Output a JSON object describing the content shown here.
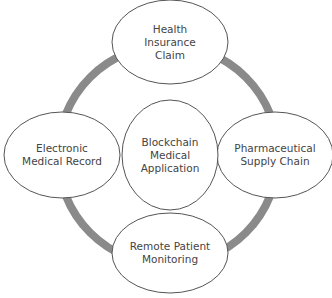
{
  "diagram": {
    "center": {
      "label": "Blockchain\nMedical\nApplication"
    },
    "nodes": [
      {
        "id": "top",
        "label": "Health\nInsurance\nClaim"
      },
      {
        "id": "right",
        "label": "Pharmaceutical\nSupply Chain"
      },
      {
        "id": "bottom",
        "label": "Remote Patient\nMonitoring"
      },
      {
        "id": "left",
        "label": "Electronic\nMedical Record"
      }
    ],
    "colors": {
      "ring": "#8a8a8a",
      "ellipse_stroke": "#555555",
      "text": "#444444",
      "background": "#ffffff"
    }
  }
}
